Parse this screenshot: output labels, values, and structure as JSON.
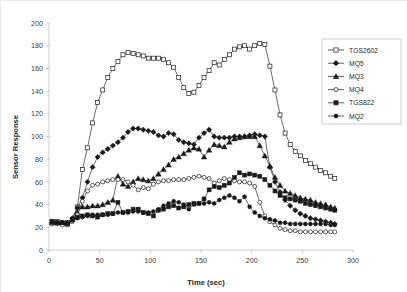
{
  "chart_data": {
    "type": "line",
    "title": "",
    "xlabel": "Time (sec)",
    "ylabel": "Sensor Response",
    "xlim": [
      0,
      300
    ],
    "ylim": [
      0,
      200
    ],
    "xticks": [
      0,
      50,
      100,
      150,
      200,
      250,
      300
    ],
    "yticks": [
      0,
      20,
      40,
      60,
      80,
      100,
      120,
      140,
      160,
      180,
      200
    ],
    "grid": false,
    "legend_position": "upper-right-outside",
    "x": [
      3,
      8,
      13,
      18,
      23,
      28,
      33,
      38,
      43,
      48,
      53,
      58,
      63,
      68,
      73,
      78,
      83,
      88,
      93,
      98,
      103,
      108,
      113,
      118,
      123,
      128,
      133,
      138,
      143,
      148,
      153,
      158,
      163,
      168,
      173,
      178,
      183,
      188,
      193,
      198,
      203,
      208,
      213,
      218,
      223,
      228,
      233,
      238,
      243,
      248,
      253,
      258,
      263,
      268,
      273,
      278,
      282
    ],
    "series": [
      {
        "name": "TGS2602",
        "marker": "open-square",
        "values": [
          25,
          25,
          24,
          23,
          27,
          38,
          71,
          90,
          112,
          130,
          141,
          152,
          160,
          166,
          172,
          174,
          173,
          172,
          171,
          169,
          169,
          169,
          168,
          165,
          161,
          152,
          143,
          138,
          139,
          145,
          152,
          158,
          165,
          163,
          168,
          172,
          177,
          179,
          180,
          177,
          180,
          182,
          181,
          162,
          141,
          119,
          103,
          93,
          87,
          83,
          79,
          76,
          73,
          70,
          68,
          65,
          63
        ]
      },
      {
        "name": "MQ5",
        "marker": "filled-diamond",
        "values": [
          24,
          24,
          24,
          24,
          28,
          37,
          46,
          60,
          73,
          82,
          86,
          89,
          92,
          95,
          99,
          104,
          107,
          107,
          106,
          105,
          104,
          101,
          100,
          103,
          102,
          97,
          95,
          94,
          93,
          99,
          103,
          106,
          100,
          99,
          99,
          99,
          100,
          100,
          100,
          101,
          102,
          101,
          100,
          73,
          60,
          51,
          44,
          39,
          35,
          32,
          30,
          28,
          27,
          26,
          25,
          24,
          23
        ]
      },
      {
        "name": "MQ3",
        "marker": "filled-triangle",
        "values": [
          24,
          24,
          24,
          23,
          27,
          33,
          38,
          38,
          39,
          39,
          40,
          42,
          44,
          65,
          58,
          56,
          60,
          63,
          62,
          61,
          63,
          67,
          71,
          75,
          80,
          82,
          85,
          88,
          90,
          89,
          82,
          88,
          93,
          92,
          91,
          95,
          98,
          99,
          100,
          100,
          100,
          92,
          83,
          74,
          64,
          57,
          52,
          50,
          48,
          46,
          45,
          44,
          42,
          41,
          40,
          38,
          37
        ]
      },
      {
        "name": "MQ4",
        "marker": "open-circle",
        "values": [
          23,
          23,
          22,
          22,
          25,
          31,
          43,
          52,
          57,
          58,
          60,
          61,
          62,
          62,
          62,
          60,
          57,
          53,
          55,
          54,
          58,
          60,
          61,
          61,
          62,
          62,
          62,
          63,
          64,
          65,
          64,
          63,
          59,
          61,
          63,
          62,
          61,
          60,
          60,
          59,
          56,
          42,
          30,
          25,
          22,
          19,
          18,
          17,
          17,
          16,
          16,
          16,
          16,
          16,
          16,
          16,
          16
        ]
      },
      {
        "name": "TGS822",
        "marker": "filled-square",
        "values": [
          25,
          24,
          24,
          24,
          27,
          29,
          30,
          31,
          30,
          29,
          31,
          32,
          32,
          42,
          33,
          34,
          36,
          36,
          33,
          32,
          30,
          35,
          36,
          38,
          39,
          37,
          38,
          40,
          41,
          41,
          45,
          53,
          56,
          55,
          57,
          59,
          64,
          68,
          66,
          67,
          66,
          65,
          62,
          57,
          52,
          48,
          46,
          45,
          44,
          43,
          41,
          40,
          39,
          38,
          37,
          36,
          35
        ]
      },
      {
        "name": "MQ2",
        "marker": "filled-circle",
        "values": [
          24,
          24,
          24,
          23,
          26,
          28,
          29,
          30,
          31,
          31,
          31,
          31,
          32,
          33,
          33,
          33,
          34,
          34,
          33,
          33,
          34,
          36,
          39,
          41,
          43,
          42,
          40,
          36,
          40,
          41,
          41,
          42,
          41,
          44,
          46,
          48,
          46,
          43,
          47,
          38,
          33,
          30,
          28,
          27,
          26,
          24,
          24,
          23,
          23,
          23,
          23,
          23,
          23,
          23,
          23,
          22,
          22
        ]
      }
    ]
  }
}
